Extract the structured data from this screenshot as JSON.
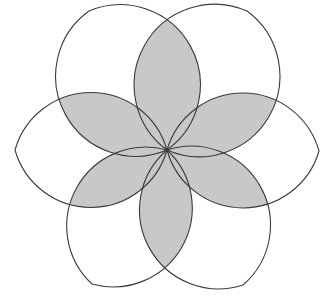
{
  "diagram": {
    "type": "six-petal lens rosette",
    "width": 334,
    "height": 300,
    "center": [
      167,
      150
    ],
    "arc_radius": 79,
    "petal_tips": [
      [
        319,
        151
      ],
      [
        247,
        11
      ],
      [
        89,
        11
      ],
      [
        15,
        150
      ],
      [
        92,
        284
      ],
      [
        243,
        285
      ]
    ],
    "colors": {
      "background": "#ffffff",
      "petal_fill": "#ffffff",
      "overlap_fill": "#c8c8c8",
      "stroke": "#3a3a3a"
    },
    "stroke_width": 1.1
  }
}
